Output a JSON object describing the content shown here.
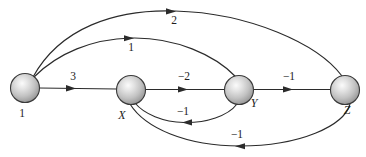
{
  "figure": {
    "background_color": "#ffffff",
    "stroke_color": "#2b2b2b",
    "node_fill_light": "#f2f2f2",
    "node_fill_dark": "#8d8d8d",
    "node_outline": "#3a3a3a"
  },
  "nodes": [
    {
      "id": "n1",
      "label": "1",
      "cx": 25,
      "cy": 88,
      "r": 14.5,
      "label_x": 22,
      "label_y": 117,
      "italic": false
    },
    {
      "id": "nX",
      "label": "X",
      "cx": 131,
      "cy": 90,
      "r": 14.5,
      "label_x": 122,
      "label_y": 119,
      "italic": true
    },
    {
      "id": "nY",
      "label": "Y",
      "cx": 239,
      "cy": 90,
      "r": 14.5,
      "label_x": 254,
      "label_y": 107,
      "italic": true
    },
    {
      "id": "nZ",
      "label": "Z",
      "cx": 345,
      "cy": 90,
      "r": 14.5,
      "label_x": 347,
      "label_y": 114,
      "italic": true
    }
  ],
  "edges": [
    {
      "id": "e-1-X",
      "from": "1",
      "to": "X",
      "weight": "3",
      "label_x": 73,
      "label_y": 80,
      "arrow_x": 74,
      "arrow_y": 88,
      "arrow_dir": "right",
      "shape": "straight"
    },
    {
      "id": "e-X-Y",
      "from": "X",
      "to": "Y",
      "weight": "−2",
      "label_x": 184,
      "label_y": 80,
      "arrow_x": 186,
      "arrow_y": 89,
      "arrow_dir": "right",
      "shape": "straight"
    },
    {
      "id": "e-Y-Z",
      "from": "Y",
      "to": "Z",
      "weight": "−1",
      "label_x": 289,
      "label_y": 80,
      "arrow_x": 291,
      "arrow_y": 89,
      "arrow_dir": "right",
      "shape": "straight"
    },
    {
      "id": "e-1-Z",
      "from": "1",
      "to": "Z",
      "weight": "2",
      "label_x": 174,
      "label_y": 24,
      "arrow_x": 172,
      "arrow_y": 11,
      "arrow_dir": "right",
      "shape": "arc-top-outer"
    },
    {
      "id": "e-1-Y",
      "from": "1",
      "to": "Y",
      "weight": "1",
      "label_x": 131,
      "label_y": 51,
      "arrow_x": 131,
      "arrow_y": 38,
      "arrow_dir": "right",
      "shape": "arc-top-inner"
    },
    {
      "id": "e-Y-X",
      "from": "Y",
      "to": "X",
      "weight": "−1",
      "label_x": 183,
      "label_y": 115,
      "arrow_x": 186,
      "arrow_y": 122,
      "arrow_dir": "left",
      "shape": "arc-bottom-inner"
    },
    {
      "id": "e-Z-X",
      "from": "Z",
      "to": "X",
      "weight": "−1",
      "label_x": 237,
      "label_y": 138,
      "arrow_x": 239,
      "arrow_y": 146,
      "arrow_dir": "left",
      "shape": "arc-bottom-outer"
    }
  ]
}
